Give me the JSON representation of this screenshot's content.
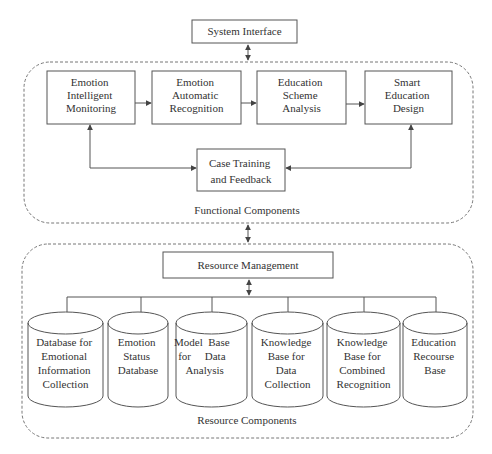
{
  "top": {
    "system_interface": "System Interface"
  },
  "functional": {
    "title": "Functional Components",
    "modules": [
      {
        "lines": [
          "Emotion",
          "Intelligent",
          "Monitoring"
        ]
      },
      {
        "lines": [
          "Emotion",
          "Automatic",
          "Recognition"
        ]
      },
      {
        "lines": [
          "Education",
          "Scheme",
          "Analysis"
        ]
      },
      {
        "lines": [
          "Smart",
          "Education",
          "Design"
        ]
      }
    ],
    "feedback": {
      "lines": [
        "Case Training",
        "and Feedback"
      ]
    }
  },
  "resource": {
    "title": "Resource Components",
    "management": "Resource Management",
    "databases": [
      {
        "lines": [
          "Database for",
          "Emotional",
          "Information",
          "Collection"
        ]
      },
      {
        "lines": [
          "Emotion",
          "Status",
          "Database"
        ]
      },
      {
        "lines": [
          "Model  Base",
          "for     Data",
          "Analysis"
        ]
      },
      {
        "lines": [
          "Knowledge",
          "Base for",
          "Data",
          "Collection"
        ]
      },
      {
        "lines": [
          "Knowledge",
          "Base for",
          "Combined",
          "Recognition"
        ]
      },
      {
        "lines": [
          "Education",
          "Recourse",
          "Base"
        ]
      }
    ]
  },
  "colors": {
    "stroke": "#555555",
    "text": "#333333",
    "dashed": "#777777"
  }
}
